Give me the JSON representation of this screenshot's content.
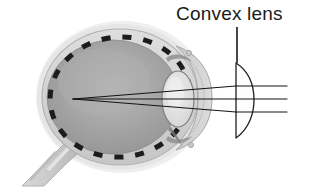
{
  "figure": {
    "title": "Convex lens",
    "type": "diagram",
    "background_color": "#ffffff",
    "ink_color": "#1a1a1a"
  },
  "labels": [
    {
      "id": "convex-lens",
      "text": "Convex lens",
      "x": 176,
      "y": 3,
      "font_size": 19,
      "color": "#1a1a1a",
      "leader_line": {
        "x": 237,
        "y1": 27,
        "y2": 63,
        "color": "#1a1a1a"
      }
    }
  ],
  "eye": {
    "name": "eyeball-cross-section",
    "outer_halo_color": "#e7e7e7",
    "sclera_color": "#d4d4d4",
    "sclera_outline_color": "#b6b6b6",
    "vitreous_color": "#9d9d9d",
    "vitreous_highlight_color": "#b2b2b2",
    "center": {
      "cx": 120,
      "cy": 97
    },
    "radius_x": 78,
    "radius_y": 68,
    "retina_ring": {
      "name": "retina-dashed-ring",
      "dash_color": "#1c1c1c",
      "dash_count": 22,
      "dash_length": 9,
      "dash_width": 5
    },
    "crystalline_lens": {
      "name": "eye-lens",
      "cx": 178,
      "cy": 99,
      "rx": 16,
      "ry": 27,
      "fill": "#e3e3e3",
      "stroke": "#7e7e7e"
    },
    "cornea": {
      "name": "cornea",
      "fill": "#cfcfcf",
      "stroke": "#9a9a9a"
    },
    "optic_nerve": {
      "name": "optic-nerve",
      "fill": "#cccccc",
      "stroke": "#a8a8a8"
    },
    "ciliary_marks": [
      {
        "name": "ciliary-mark-top",
        "cx": 176,
        "cy": 63
      },
      {
        "name": "ciliary-mark-bottom",
        "cx": 178,
        "cy": 137
      }
    ]
  },
  "convex_lens": {
    "name": "convex-lens-optic",
    "type": "plano-convex",
    "flat_side": "left",
    "x_flat": 236,
    "top_y": 63,
    "bottom_y": 138,
    "bulge_x": 252,
    "fill": "#fdfdfd",
    "stroke": "#1f1f1f",
    "stroke_width": 1.3
  },
  "light_rays": {
    "name": "parallel-light-rays",
    "count": 3,
    "color": "#141414",
    "stroke_width": 1.1,
    "entry_x": 287,
    "focal_point": {
      "x": 73,
      "y": 99
    },
    "rays": [
      {
        "id": "ray-upper",
        "incoming_y": 86,
        "lens_exit_x": 236,
        "lens_exit_y": 86
      },
      {
        "id": "ray-middle",
        "incoming_y": 99,
        "lens_exit_x": 236,
        "lens_exit_y": 99
      },
      {
        "id": "ray-lower",
        "incoming_y": 112,
        "lens_exit_x": 236,
        "lens_exit_y": 112
      }
    ]
  }
}
